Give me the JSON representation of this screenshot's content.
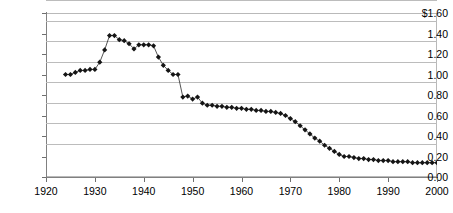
{
  "chart_data": {
    "type": "line",
    "title": "",
    "subtitle": "",
    "xlabel": "",
    "ylabel": "",
    "xlim": [
      1920,
      2000
    ],
    "ylim": [
      0.0,
      1.6
    ],
    "grid": true,
    "gridlines": "horizontal",
    "legend": "none",
    "marker": "diamond",
    "marker_color": "#151515",
    "line_color": "#2a2a2a",
    "y_ticks": [
      0.0,
      0.2,
      0.4,
      0.6,
      0.8,
      1.0,
      1.2,
      1.4,
      1.6
    ],
    "y_tick_labels": [
      "0.00",
      "0.20",
      "0.40",
      "0.60",
      "0.80",
      "1.00",
      "1.20",
      "1.40",
      "$1.60"
    ],
    "x_ticks": [
      1920,
      1930,
      1940,
      1950,
      1960,
      1970,
      1980,
      1990,
      2000
    ],
    "x_tick_labels": [
      "1920",
      "1930",
      "1940",
      "1950",
      "1960",
      "1970",
      "1980",
      "1990",
      "2000"
    ],
    "x": [
      1924,
      1925,
      1926,
      1927,
      1928,
      1929,
      1930,
      1931,
      1932,
      1933,
      1934,
      1935,
      1936,
      1937,
      1938,
      1939,
      1940,
      1941,
      1942,
      1943,
      1944,
      1945,
      1946,
      1947,
      1948,
      1949,
      1950,
      1951,
      1952,
      1953,
      1954,
      1955,
      1956,
      1957,
      1958,
      1959,
      1960,
      1961,
      1962,
      1963,
      1964,
      1965,
      1966,
      1967,
      1968,
      1969,
      1970,
      1971,
      1972,
      1973,
      1974,
      1975,
      1976,
      1977,
      1978,
      1979,
      1980,
      1981,
      1982,
      1983,
      1984,
      1985,
      1986,
      1987,
      1988,
      1989,
      1990,
      1991,
      1992,
      1993,
      1994,
      1995,
      1996,
      1997,
      1998,
      1999,
      2000
    ],
    "values": [
      1.0,
      1.0,
      1.02,
      1.04,
      1.04,
      1.05,
      1.05,
      1.12,
      1.24,
      1.38,
      1.38,
      1.34,
      1.33,
      1.3,
      1.25,
      1.29,
      1.29,
      1.29,
      1.28,
      1.17,
      1.09,
      1.04,
      1.0,
      1.0,
      0.78,
      0.79,
      0.76,
      0.78,
      0.72,
      0.7,
      0.7,
      0.69,
      0.69,
      0.68,
      0.68,
      0.67,
      0.67,
      0.66,
      0.66,
      0.65,
      0.65,
      0.64,
      0.64,
      0.63,
      0.62,
      0.6,
      0.57,
      0.54,
      0.5,
      0.46,
      0.42,
      0.38,
      0.35,
      0.31,
      0.28,
      0.25,
      0.22,
      0.2,
      0.2,
      0.19,
      0.18,
      0.18,
      0.17,
      0.17,
      0.16,
      0.16,
      0.16,
      0.15,
      0.15,
      0.15,
      0.15,
      0.14,
      0.14,
      0.14,
      0.14,
      0.14,
      0.14
    ]
  }
}
